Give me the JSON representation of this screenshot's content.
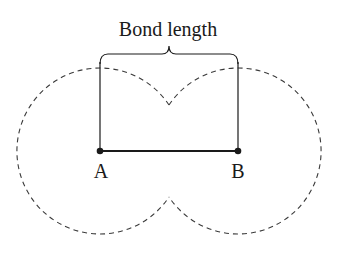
{
  "diagram": {
    "title_label": "Bond length",
    "atoms": [
      {
        "label": "A",
        "x": 100,
        "y": 151
      },
      {
        "label": "B",
        "x": 238,
        "y": 151
      }
    ],
    "atom_radius_dashed": 83,
    "colors": {
      "line": "#1a1a1a",
      "dashed": "#3a3a3a"
    }
  }
}
